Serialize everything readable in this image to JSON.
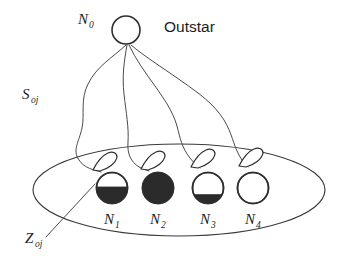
{
  "diagram": {
    "title_label": "Outstar",
    "source_node": {
      "name": "N",
      "subscript": "0"
    },
    "weight_label": {
      "name": "S",
      "subscript": "oj"
    },
    "trace_label": {
      "name": "Z",
      "subscript": "oj"
    },
    "target_nodes": [
      {
        "name": "N",
        "subscript": "1",
        "fill_fraction": 0.56,
        "fill_state": "partial"
      },
      {
        "name": "N",
        "subscript": "2",
        "fill_fraction": 1.0,
        "fill_state": "full"
      },
      {
        "name": "N",
        "subscript": "3",
        "fill_fraction": 0.3,
        "fill_state": "partial"
      },
      {
        "name": "N",
        "subscript": "4",
        "fill_fraction": 0.0,
        "fill_state": "empty"
      }
    ],
    "colors": {
      "stroke": "#3a3a3a",
      "node_outline": "#2e2e2e",
      "node_fill": "#2b2b2b",
      "background": "#ffffff",
      "text": "#1c1c1c"
    }
  }
}
